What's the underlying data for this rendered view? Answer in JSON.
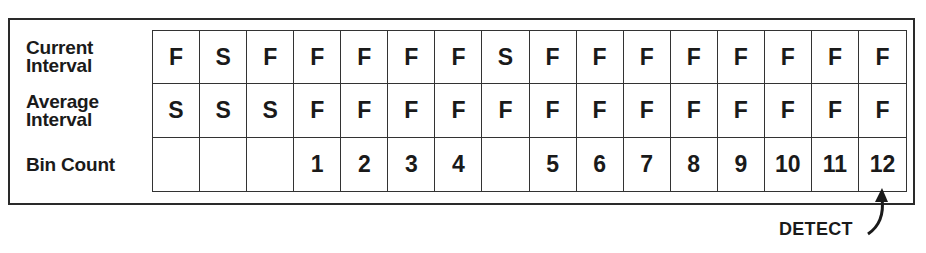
{
  "row_labels": {
    "current": [
      "Current",
      "Interval"
    ],
    "average": [
      "Average",
      "Interval"
    ],
    "bin": "Bin Count"
  },
  "rows": {
    "current_interval": [
      "F",
      "S",
      "F",
      "F",
      "F",
      "F",
      "F",
      "S",
      "F",
      "F",
      "F",
      "F",
      "F",
      "F",
      "F",
      "F"
    ],
    "average_interval": [
      "S",
      "S",
      "S",
      "F",
      "F",
      "F",
      "F",
      "F",
      "F",
      "F",
      "F",
      "F",
      "F",
      "F",
      "F",
      "F"
    ],
    "bin_count": [
      "",
      "",
      "",
      "1",
      "2",
      "3",
      "4",
      "",
      "5",
      "6",
      "7",
      "8",
      "9",
      "10",
      "11",
      "12"
    ]
  },
  "annotation": {
    "label": "DETECT",
    "points_to_column": 16
  },
  "colors": {
    "ink": "#1a1a1a",
    "background": "#ffffff"
  }
}
